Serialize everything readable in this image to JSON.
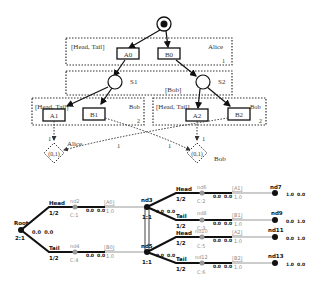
{
  "top_diagram": {
    "start_node": "initial-state",
    "groups": [
      {
        "id": "alice-info-set-1",
        "actions_label": "[Head, Tail]",
        "player": "Alice",
        "index": "1"
      },
      {
        "id": "bob-chance-set",
        "player_label": "[Bob]"
      },
      {
        "id": "bob-info-set-left",
        "actions_label": "[Head, Tail]",
        "player": "Bob",
        "index": "2"
      },
      {
        "id": "bob-info-set-right",
        "actions_label": "[Head, Tail]",
        "player": "Bob",
        "index": "2"
      }
    ],
    "action_boxes": [
      "A0",
      "B0",
      "A1",
      "B1",
      "A2",
      "B2"
    ],
    "states": [
      "S1",
      "S2"
    ],
    "terminals": [
      {
        "label": "(0,1)",
        "owner": "Alice"
      },
      {
        "label": "(0,1)",
        "owner": "Bob"
      }
    ],
    "edge_weights": [
      "1",
      "1",
      "1",
      "1"
    ]
  },
  "bottom_tree": {
    "root": {
      "label": "Root",
      "ratio": "2:1",
      "values": "0.0  0.0"
    },
    "branches": [
      {
        "action": "Head",
        "prob": "1/2",
        "node": "nd2",
        "count": "C:1",
        "edge_vals": "0.0  0.0",
        "move": "[A0]",
        "move_val": "1.0"
      },
      {
        "action": "Tail",
        "prob": "1/2",
        "node": "nd4",
        "count": "C:4",
        "edge_vals": "0.0  0.0",
        "move": "[B0]",
        "move_val": "1.0"
      }
    ],
    "mid_nodes": [
      {
        "label": "nd3",
        "ratio": "1:1",
        "values": "0.0  0.0"
      },
      {
        "label": "nd5",
        "ratio": "1:1",
        "values": "0.0  0.0"
      }
    ],
    "sub_branches": [
      {
        "action": "Head",
        "prob": "1/2",
        "node": "nd6",
        "count": "C:2",
        "edge_vals": "0.0  0.0",
        "move": "[A1]",
        "move_val": "1.0",
        "leaf": "nd7",
        "payoff": "1.0  0.0"
      },
      {
        "action": "Tail",
        "prob": "1/2",
        "node": "nd8",
        "count": "C:3",
        "edge_vals": "0.0  0.0",
        "move": "[B1]",
        "move_val": "1.0",
        "leaf": "nd9",
        "payoff": "0.0  1.0"
      },
      {
        "action": "Head",
        "prob": "1/2",
        "node": "nd10",
        "count": "C:5",
        "edge_vals": "0.0  0.0",
        "move": "[A2]",
        "move_val": "1.0",
        "leaf": "nd11",
        "payoff": "0.0  1.0"
      },
      {
        "action": "Tail",
        "prob": "1/2",
        "node": "nd12",
        "count": "C:6",
        "edge_vals": "0.0  0.0",
        "move": "[B2]",
        "move_val": "1.0",
        "leaf": "nd13",
        "payoff": "1.0  0.0"
      }
    ]
  }
}
